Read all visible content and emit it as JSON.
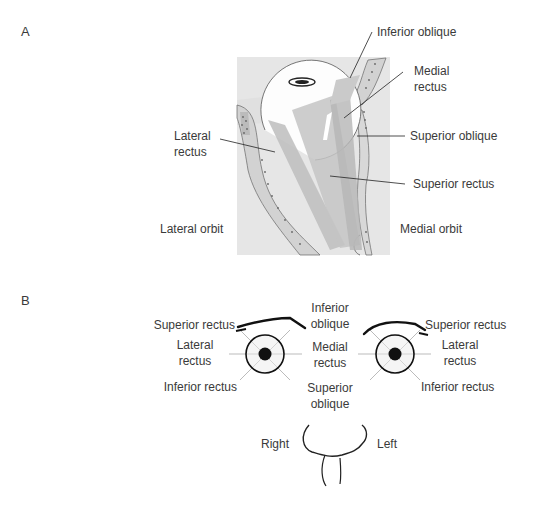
{
  "panel_a": {
    "letter": "A",
    "labels": {
      "inferior_oblique": "Inferior oblique",
      "medial_rectus_1": "Medial",
      "medial_rectus_2": "rectus",
      "lateral_rectus_1": "Lateral",
      "lateral_rectus_2": "rectus",
      "superior_oblique": "Superior oblique",
      "superior_rectus": "Superior rectus",
      "lateral_orbit": "Lateral orbit",
      "medial_orbit": "Medial orbit"
    }
  },
  "panel_b": {
    "letter": "B",
    "right_eye": {
      "superior_rectus": "Superior rectus",
      "lateral_rectus_1": "Lateral",
      "lateral_rectus_2": "rectus",
      "inferior_rectus": "Inferior rectus"
    },
    "center": {
      "inferior_oblique_1": "Inferior",
      "inferior_oblique_2": "oblique",
      "medial_rectus_1": "Medial",
      "medial_rectus_2": "rectus",
      "superior_oblique_1": "Superior",
      "superior_oblique_2": "oblique"
    },
    "left_eye": {
      "superior_rectus": "Superior rectus",
      "lateral_rectus_1": "Lateral",
      "lateral_rectus_2": "rectus",
      "inferior_rectus": "Inferior rectus"
    },
    "side_right": "Right",
    "side_left": "Left"
  }
}
